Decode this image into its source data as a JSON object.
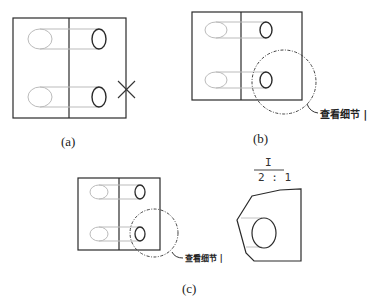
{
  "figure": {
    "panels": [
      {
        "id": "a",
        "caption": "(a)",
        "elements": [
          "part-view",
          "cross-marker"
        ]
      },
      {
        "id": "b",
        "caption": "(b)",
        "elements": [
          "part-view",
          "detail-circle"
        ],
        "detail_label": "查看细节 |"
      },
      {
        "id": "c",
        "caption": "(c)",
        "elements": [
          "part-view",
          "detail-circle",
          "detail-view"
        ],
        "detail_label": "查看细节 |",
        "detail_view": {
          "name": "I",
          "scale": "2 : 1"
        }
      }
    ]
  },
  "colors": {
    "outline": "#2a2a2a",
    "hidden": "#b8b8b8",
    "dashdot": "#444444"
  }
}
